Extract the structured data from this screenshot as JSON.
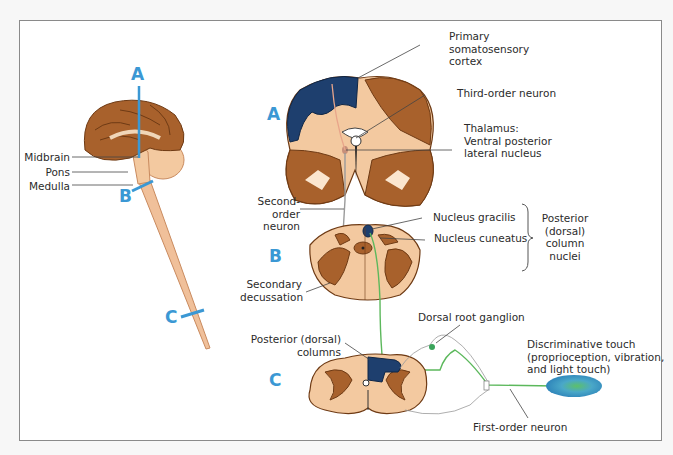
{
  "figure": {
    "type": "anatomical diagram",
    "colors": {
      "section_marker": "#3b98d4",
      "cortex_highlight": "#1e3f6e",
      "brain_dark": "#8b4f22",
      "brain_light": "#f3c9a0",
      "first_order_fiber": "#5cb85c",
      "second_order_fiber": "#a9a9a9"
    }
  },
  "overview": {
    "section_labels": {
      "a": "A",
      "b": "B",
      "c": "C"
    },
    "labels": {
      "midbrain": "Midbrain",
      "pons": "Pons",
      "medulla": "Medulla"
    }
  },
  "sections": {
    "a": {
      "marker": "A",
      "labels": {
        "cortex": [
          "Primary",
          "somatosensory",
          "cortex"
        ],
        "third_order": "Third-order neuron",
        "thalamus": [
          "Thalamus:",
          "Ventral posterior",
          "lateral nucleus"
        ]
      }
    },
    "b": {
      "marker": "B",
      "labels": {
        "second_order": [
          "Second-",
          "order",
          "neuron"
        ],
        "gracilis": "Nucleus gracilis",
        "cuneatus": "Nucleus cuneatus",
        "column_nuclei": [
          "Posterior",
          "(dorsal)",
          "column",
          "nuclei"
        ],
        "decussation": [
          "Secondary",
          "decussation"
        ]
      }
    },
    "c": {
      "marker": "C",
      "labels": {
        "dorsal_columns": [
          "Posterior (dorsal)",
          "columns"
        ],
        "drg": "Dorsal root ganglion",
        "receptor": [
          "Discriminative touch",
          "(proprioception, vibration,",
          "and light touch)"
        ],
        "first_order": "First-order neuron"
      }
    }
  }
}
